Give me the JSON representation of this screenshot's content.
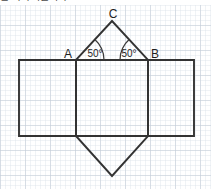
{
  "header": {
    "clipped_text": "은 사다리꼴이다."
  },
  "figure": {
    "type": "geometry-diagram",
    "vertex_labels": {
      "a": "A",
      "b": "B",
      "c": "C"
    },
    "angle_labels": {
      "at_a": "50°",
      "at_b": "50°"
    },
    "colors": {
      "stroke": "#333333",
      "grid_minor": "#d8e0e8",
      "grid_major": "#c3ccd6",
      "paper": "#ffffff",
      "label_text": "#1f1f1f"
    },
    "grid": {
      "minor_spacing_px": 5,
      "major_every": 5,
      "show": true
    },
    "geometry": {
      "square": {
        "top_left": [
          76,
          60
        ],
        "top_right": [
          148,
          60
        ],
        "bottom_right": [
          148,
          136
        ],
        "bottom_left": [
          76,
          136
        ]
      },
      "left_rectangle": {
        "top_left": [
          19,
          60
        ],
        "top_right": [
          76,
          60
        ],
        "bottom_right": [
          76,
          136
        ],
        "bottom_left": [
          19,
          136
        ]
      },
      "right_rectangle": {
        "top_left": [
          148,
          60
        ],
        "top_right": [
          194,
          60
        ],
        "bottom_right": [
          194,
          136
        ],
        "bottom_left": [
          148,
          136
        ]
      },
      "top_triangle": {
        "a": [
          76,
          60
        ],
        "b": [
          148,
          60
        ],
        "apex_c": [
          112,
          21
        ]
      },
      "bottom_triangle": {
        "left": [
          76,
          136
        ],
        "right": [
          148,
          136
        ],
        "apex": [
          112,
          176
        ]
      }
    },
    "label_positions": {
      "a": [
        68,
        57
      ],
      "b": [
        152,
        57
      ],
      "c": [
        112,
        16
      ],
      "angle_a": [
        93,
        56
      ],
      "angle_b": [
        126,
        56
      ]
    }
  }
}
